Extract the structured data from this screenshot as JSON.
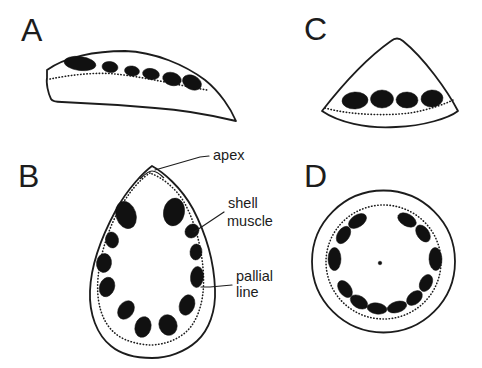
{
  "figure": {
    "background": "#ffffff",
    "ink_color": "#1c1c1c",
    "scar_color": "#111111",
    "panels": [
      {
        "letter": "A"
      },
      {
        "letter": "B"
      },
      {
        "letter": "C"
      },
      {
        "letter": "D"
      }
    ],
    "annotations": {
      "apex": {
        "label": "apex"
      },
      "shell_muscle": {
        "label": "shell muscle",
        "line1": "shell",
        "line2": "muscle"
      },
      "pallial_line": {
        "label": "pallial line",
        "line1": "pallial",
        "line2": "line"
      }
    }
  }
}
